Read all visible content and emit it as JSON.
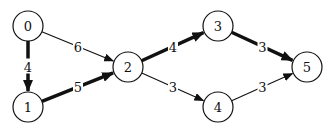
{
  "diagram": {
    "type": "weighted-directed-graph",
    "nodes": [
      {
        "id": "0",
        "label": "0",
        "x": 28,
        "y": 26
      },
      {
        "id": "1",
        "label": "1",
        "x": 28,
        "y": 107
      },
      {
        "id": "2",
        "label": "2",
        "x": 128,
        "y": 67
      },
      {
        "id": "3",
        "label": "3",
        "x": 218,
        "y": 26
      },
      {
        "id": "4",
        "label": "4",
        "x": 218,
        "y": 107
      },
      {
        "id": "5",
        "label": "5",
        "x": 307,
        "y": 67
      }
    ],
    "edges": [
      {
        "from": "0",
        "to": "1",
        "weight": "4",
        "highlighted": true
      },
      {
        "from": "0",
        "to": "2",
        "weight": "6",
        "highlighted": false
      },
      {
        "from": "1",
        "to": "2",
        "weight": "5",
        "highlighted": true
      },
      {
        "from": "2",
        "to": "3",
        "weight": "4",
        "highlighted": true
      },
      {
        "from": "2",
        "to": "4",
        "weight": "3",
        "highlighted": false
      },
      {
        "from": "3",
        "to": "5",
        "weight": "3",
        "highlighted": true
      },
      {
        "from": "4",
        "to": "5",
        "weight": "3",
        "highlighted": false
      }
    ],
    "colors": {
      "stroke": "#111111",
      "background": "#ffffff"
    }
  }
}
